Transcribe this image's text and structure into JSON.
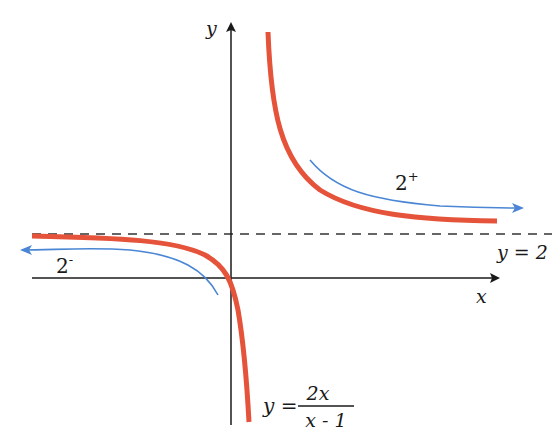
{
  "diagram": {
    "function_label": {
      "lhs": "y =",
      "numerator": "2x",
      "denominator": "x - 1"
    },
    "axes": {
      "x_label": "x",
      "y_label": "y"
    },
    "asymptote": {
      "label": "y = 2",
      "style": "dashed"
    },
    "annotations": {
      "right_limit": {
        "base": "2",
        "sup": "+"
      },
      "left_limit": {
        "base": "2",
        "sup": "-"
      }
    },
    "colors": {
      "curve": "#e5533a",
      "arrow": "#4a86d4",
      "axis": "#1a1a1a",
      "asymptote": "#333333"
    }
  }
}
